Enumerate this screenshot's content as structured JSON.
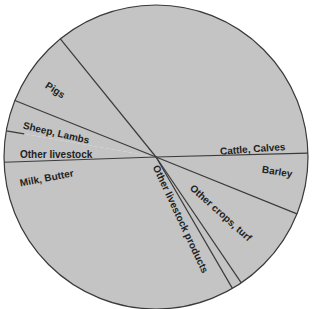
{
  "chart_data": {
    "type": "pie",
    "title": "",
    "start_angle_deg": 321,
    "direction": "clockwise",
    "colors": {
      "fill": "#c4c4c4",
      "stroke": "#3a3a3a",
      "text": "#222222",
      "background": "#ffffff"
    },
    "slices": [
      {
        "label": "Cattle, Calves",
        "value": 35.4
      },
      {
        "label": "Barley",
        "value": 6.5
      },
      {
        "label": "Other crops, turf",
        "value": 9.4
      },
      {
        "label": "Other livestock products",
        "value": 1.1
      },
      {
        "label": "Milk, Butter",
        "value": 32.8
      },
      {
        "label": "Other livestock",
        "value": 3.3
      },
      {
        "label": "Sheep, Lambs",
        "value": 3.3
      },
      {
        "label": "Pigs",
        "value": 8.1
      }
    ],
    "unit": "percent",
    "legend": "none (labels placed inside slices)"
  }
}
